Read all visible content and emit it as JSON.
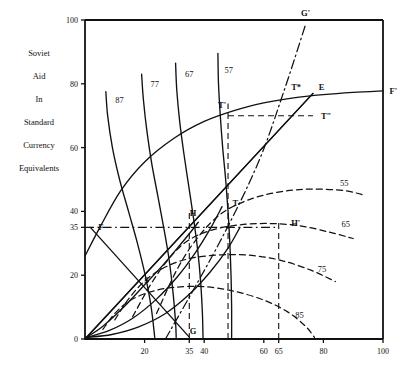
{
  "chart_data": {
    "type": "line",
    "title": "",
    "ylabel_lines": [
      "Soviet",
      "Aid",
      "In",
      "Standard",
      "Currency",
      "Equivalents"
    ],
    "xlabel": "",
    "xlim": [
      0,
      100
    ],
    "ylim": [
      0,
      100
    ],
    "xticks": [
      20,
      35,
      40,
      60,
      65,
      80,
      100
    ],
    "yticks": [
      0,
      20,
      35,
      40,
      60,
      80,
      100
    ],
    "grid": false,
    "legend": "none",
    "series": [
      {
        "name": "87",
        "style": "solid",
        "label": "87",
        "label_at": [
          11.6,
          74.0
        ],
        "points": [
          [
            7.0,
            77.5
          ],
          [
            7.6,
            70.0
          ],
          [
            9.2,
            60.0
          ],
          [
            11.6,
            50.0
          ],
          [
            14.6,
            40.0
          ],
          [
            17.6,
            30.0
          ],
          [
            20.2,
            20.0
          ],
          [
            22.2,
            10.0
          ],
          [
            23.4,
            0.5
          ]
        ]
      },
      {
        "name": "77",
        "style": "solid",
        "label": "77",
        "label_at": [
          23.4,
          79.0
        ],
        "points": [
          [
            19.0,
            83.0
          ],
          [
            19.6,
            75.0
          ],
          [
            20.8,
            65.0
          ],
          [
            22.4,
            55.0
          ],
          [
            24.4,
            45.0
          ],
          [
            26.4,
            35.0
          ],
          [
            28.2,
            25.0
          ],
          [
            29.6,
            14.0
          ],
          [
            30.4,
            5.0
          ],
          [
            30.6,
            0.5
          ]
        ]
      },
      {
        "name": "67",
        "style": "solid",
        "label": "67",
        "label_at": [
          35.0,
          82.0
        ],
        "points": [
          [
            30.4,
            86.5
          ],
          [
            30.8,
            78.0
          ],
          [
            31.8,
            68.0
          ],
          [
            33.2,
            58.0
          ],
          [
            34.8,
            48.0
          ],
          [
            36.4,
            38.0
          ],
          [
            37.8,
            28.0
          ],
          [
            38.8,
            18.0
          ],
          [
            39.4,
            8.0
          ],
          [
            39.6,
            0.5
          ]
        ]
      },
      {
        "name": "57",
        "style": "solid",
        "label": "57",
        "label_at": [
          48.2,
          83.5
        ],
        "points": [
          [
            44.6,
            89.5
          ],
          [
            44.8,
            80.0
          ],
          [
            45.4,
            70.0
          ],
          [
            46.2,
            60.0
          ],
          [
            47.2,
            50.0
          ],
          [
            48.0,
            40.0
          ],
          [
            48.6,
            30.0
          ],
          [
            49.0,
            20.0
          ],
          [
            49.2,
            10.0
          ],
          [
            49.2,
            0.5
          ]
        ]
      },
      {
        "name": "55",
        "style": "dashed",
        "label": "55",
        "label_at": [
          87.0,
          48.0
        ],
        "points": [
          [
            24.0,
            8.0
          ],
          [
            31.0,
            22.0
          ],
          [
            38.0,
            32.0
          ],
          [
            46.0,
            39.5
          ],
          [
            56.0,
            44.0
          ],
          [
            66.0,
            46.2
          ],
          [
            76.0,
            47.0
          ],
          [
            87.0,
            46.5
          ],
          [
            94.0,
            45.0
          ]
        ]
      },
      {
        "name": "65",
        "style": "dashed",
        "label": "65",
        "label_at": [
          87.5,
          35.0
        ],
        "points": [
          [
            16.0,
            7.0
          ],
          [
            22.0,
            17.0
          ],
          [
            28.0,
            25.0
          ],
          [
            34.0,
            30.5
          ],
          [
            42.0,
            34.0
          ],
          [
            52.0,
            35.8
          ],
          [
            62.0,
            36.2
          ],
          [
            72.0,
            35.5
          ],
          [
            82.0,
            33.5
          ],
          [
            90.0,
            31.5
          ]
        ]
      },
      {
        "name": "75",
        "style": "dashed",
        "label": "75",
        "label_at": [
          79.5,
          21.0
        ],
        "points": [
          [
            10.0,
            6.0
          ],
          [
            15.0,
            13.0
          ],
          [
            21.0,
            19.0
          ],
          [
            28.0,
            23.0
          ],
          [
            36.0,
            25.4
          ],
          [
            46.0,
            26.4
          ],
          [
            56.0,
            26.2
          ],
          [
            66.0,
            24.6
          ],
          [
            76.0,
            21.5
          ],
          [
            84.0,
            18.0
          ]
        ]
      },
      {
        "name": "85",
        "style": "dashed",
        "label": "85",
        "label_at": [
          72.0,
          6.5
        ],
        "points": [
          [
            6.0,
            3.0
          ],
          [
            10.0,
            8.0
          ],
          [
            15.0,
            12.0
          ],
          [
            22.0,
            14.8
          ],
          [
            30.0,
            16.2
          ],
          [
            40.0,
            16.4
          ],
          [
            50.0,
            15.0
          ],
          [
            60.0,
            12.2
          ],
          [
            68.0,
            8.5
          ],
          [
            74.0,
            4.0
          ],
          [
            77.0,
            0.5
          ]
        ]
      },
      {
        "name": "FF-prime",
        "style": "solid",
        "label": "",
        "points": [
          [
            0.0,
            26.0
          ],
          [
            5.0,
            35.0
          ],
          [
            12.0,
            46.5
          ],
          [
            20.0,
            55.5
          ],
          [
            30.0,
            63.0
          ],
          [
            40.0,
            68.2
          ],
          [
            50.0,
            71.6
          ],
          [
            60.0,
            74.0
          ],
          [
            70.0,
            75.6
          ],
          [
            80.0,
            76.6
          ],
          [
            90.0,
            77.3
          ],
          [
            100.0,
            77.8
          ]
        ]
      },
      {
        "name": "OE-ray",
        "style": "solid",
        "points": [
          [
            0.0,
            0.0
          ],
          [
            76.5,
            77.0
          ]
        ]
      },
      {
        "name": "SH-line",
        "style": "solid",
        "points": [
          [
            0.0,
            0.0
          ],
          [
            76.5,
            77.0
          ]
        ]
      },
      {
        "name": "FG-line",
        "style": "solid",
        "points": [
          [
            1.8,
            35.0
          ],
          [
            35.0,
            0.6
          ]
        ]
      },
      {
        "name": "GG-prime",
        "style": "dashdot",
        "points": [
          [
            27.0,
            0.0
          ],
          [
            45.0,
            30.0
          ],
          [
            58.0,
            55.0
          ],
          [
            66.5,
            77.0
          ],
          [
            74.0,
            98.5
          ]
        ]
      },
      {
        "name": "lower-solid-arc",
        "style": "solid",
        "points": [
          [
            0.5,
            0.5
          ],
          [
            6.0,
            4.0
          ],
          [
            13.0,
            10.0
          ],
          [
            20.0,
            17.0
          ],
          [
            26.0,
            23.0
          ],
          [
            31.0,
            28.5
          ],
          [
            35.0,
            33.0
          ],
          [
            38.0,
            36.6
          ]
        ]
      },
      {
        "name": "lower-solid-arc-2",
        "style": "solid",
        "points": [
          [
            0.5,
            0.5
          ],
          [
            8.0,
            2.6
          ],
          [
            16.0,
            6.5
          ],
          [
            24.0,
            12.5
          ],
          [
            31.0,
            19.5
          ],
          [
            37.0,
            27.0
          ],
          [
            42.0,
            34.5
          ],
          [
            46.0,
            41.5
          ]
        ]
      },
      {
        "name": "lower-solid-arc-3",
        "style": "solid",
        "points": [
          [
            0.5,
            0.5
          ],
          [
            9.0,
            1.4
          ],
          [
            18.0,
            3.8
          ],
          [
            27.0,
            8.0
          ],
          [
            35.0,
            14.0
          ],
          [
            42.0,
            21.0
          ],
          [
            48.0,
            28.5
          ],
          [
            52.0,
            35.0
          ]
        ]
      }
    ],
    "points_of_interest": [
      {
        "label": "G'",
        "x": 74.0,
        "y": 100.5,
        "anchor": "above"
      },
      {
        "label": "F'",
        "x": 101.5,
        "y": 77.8,
        "anchor": "right"
      },
      {
        "label": "E",
        "x": 77.8,
        "y": 79.0,
        "anchor": "right"
      },
      {
        "label": "T*",
        "x": 73.2,
        "y": 79.0,
        "anchor": "left"
      },
      {
        "label": "T'",
        "x": 48.0,
        "y": 73.5,
        "anchor": "left"
      },
      {
        "label": "T\"",
        "x": 78.5,
        "y": 70.0,
        "anchor": "right"
      },
      {
        "label": "T",
        "x": 48.8,
        "y": 42.5,
        "anchor": "right"
      },
      {
        "label": "H'",
        "x": 68.5,
        "y": 36.5,
        "anchor": "right"
      },
      {
        "label": "H",
        "x": 34.5,
        "y": 39.5,
        "anchor": "right"
      },
      {
        "label": "F",
        "x": 3.8,
        "y": 35.0,
        "anchor": "right"
      },
      {
        "label": "S",
        "x": 19.2,
        "y": 18.5,
        "anchor": "right"
      },
      {
        "label": "G",
        "x": 34.5,
        "y": 2.5,
        "anchor": "right"
      }
    ],
    "guide_lines": [
      {
        "name": "h-dash-35",
        "style": "dashdot",
        "from": [
          0.0,
          35.0
        ],
        "to": [
          65.0,
          35.0
        ]
      },
      {
        "name": "h-dash-Tprime",
        "style": "dashed",
        "from": [
          48.0,
          70.0
        ],
        "to": [
          76.5,
          70.0
        ]
      },
      {
        "name": "v-dash-Tprime",
        "style": "dashed",
        "from": [
          48.0,
          0.0
        ],
        "to": [
          48.0,
          73.8
        ]
      },
      {
        "name": "v-dash-35",
        "style": "dashed",
        "from": [
          35.0,
          0.0
        ],
        "to": [
          35.0,
          39.5
        ]
      },
      {
        "name": "v-dash-65",
        "style": "dashed",
        "from": [
          65.0,
          0.0
        ],
        "to": [
          65.0,
          36.5
        ]
      }
    ]
  }
}
